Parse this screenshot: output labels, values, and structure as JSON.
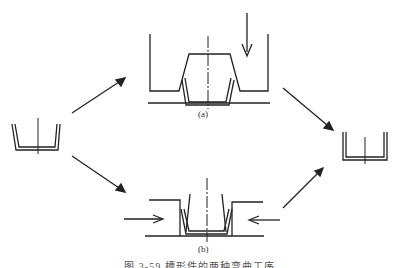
{
  "figure": {
    "label_a": "(a)",
    "label_b": "(b)",
    "caption": "图 3-59  槽形件的两种弯曲工序"
  },
  "colors": {
    "stroke": "#222222",
    "background": "#ffffff"
  }
}
